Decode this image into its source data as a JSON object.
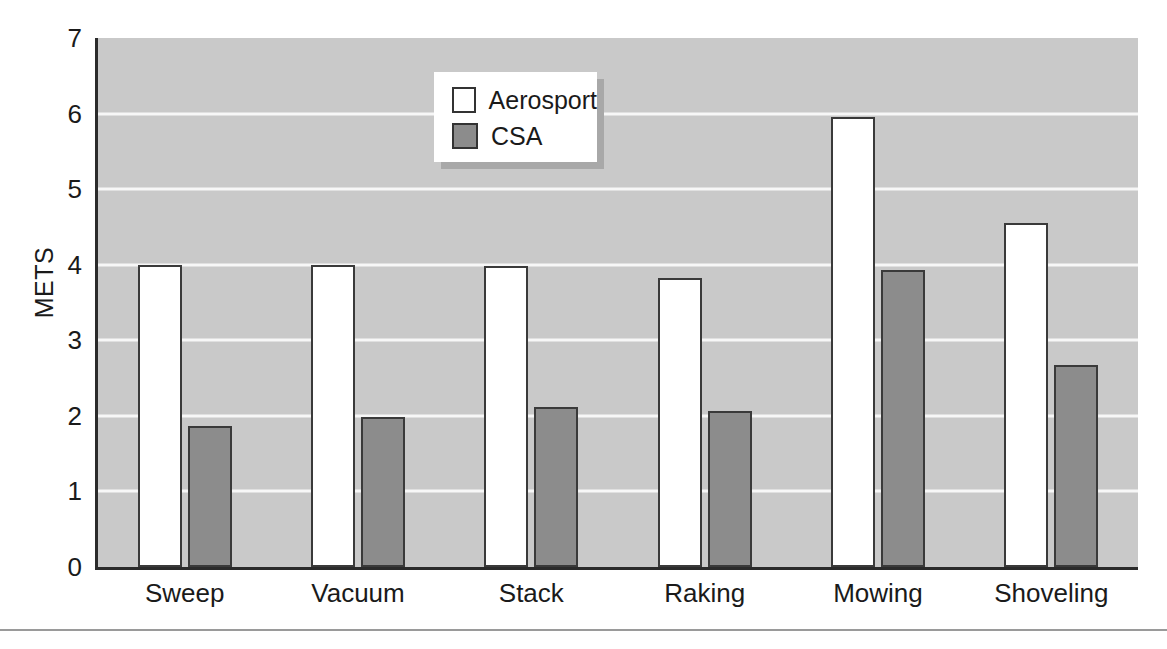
{
  "chart_data": {
    "type": "bar",
    "title": "",
    "xlabel": "",
    "ylabel": "METS",
    "categories": [
      "Sweep",
      "Vacuum",
      "Stack",
      "Raking",
      "Mowing",
      "Shoveling"
    ],
    "series": [
      {
        "name": "Aerosport",
        "color": "#ffffff",
        "values": [
          4.0,
          4.0,
          3.98,
          3.83,
          5.95,
          4.55
        ]
      },
      {
        "name": "CSA",
        "color": "#8c8c8c",
        "values": [
          1.87,
          1.98,
          2.12,
          2.06,
          3.93,
          2.67
        ]
      }
    ],
    "ylim": [
      0,
      7
    ],
    "yticks": [
      0,
      1,
      2,
      3,
      4,
      5,
      6,
      7
    ],
    "ytick_labels": [
      "0",
      "1",
      "2",
      "3",
      "4",
      "5",
      "6",
      "7"
    ],
    "grid": true,
    "grid_color": "#f7f7f7",
    "plot_background": "#c9c9c9",
    "legend_position": "upper-left-inside"
  },
  "legend": {
    "entries": [
      {
        "label": "Aerosport"
      },
      {
        "label": "CSA"
      }
    ]
  }
}
